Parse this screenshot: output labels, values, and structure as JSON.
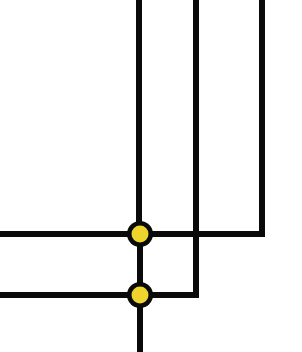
{
  "figure": {
    "name": "cladogram",
    "width": 302,
    "height": 352,
    "background_color": "#FFFFFF",
    "orientation": "tips-at-top-and-left, root-at-bottom",
    "style": "rectangular / square cladogram",
    "line_color": "#0A0A0A",
    "line_width": 6,
    "node_fill_color": "#EFD42E",
    "node_stroke_color": "#0A0A0A",
    "node_radius": 13,
    "node_inner_radius": 8.5
  },
  "chart_data": {
    "type": "diagram",
    "title": "",
    "xlabel": "",
    "ylabel": "",
    "grid": false,
    "legend": false,
    "tips": [
      {
        "id": "tip-1",
        "label": "",
        "x": 139,
        "y_top": 0,
        "y_end": 234,
        "direction": "up"
      },
      {
        "id": "tip-2",
        "label": "",
        "x": 196,
        "y_top": 0,
        "y_end": 295,
        "direction": "up"
      },
      {
        "id": "tip-3",
        "label": "",
        "x": 262,
        "y_top": 0,
        "y_end": 234,
        "direction": "up"
      },
      {
        "id": "tip-4",
        "label": "",
        "x": 0,
        "y": 234,
        "direction": "left"
      },
      {
        "id": "tip-5",
        "label": "",
        "x": 0,
        "y": 295,
        "direction": "left"
      }
    ],
    "internal_nodes": [
      {
        "id": "node-1",
        "cx": 140,
        "cy": 234,
        "fill": "#EFD42E",
        "stroke": "#0A0A0A",
        "radius": 13
      },
      {
        "id": "node-2",
        "cx": 140,
        "cy": 295,
        "fill": "#EFD42E",
        "stroke": "#0A0A0A",
        "radius": 13
      }
    ],
    "edges": [
      {
        "id": "edge-tip1-vertical",
        "path": "M 139 0 L 139 234"
      },
      {
        "id": "edge-tip2-vertical",
        "path": "M 196 0 L 196 295"
      },
      {
        "id": "edge-tip3-vertical",
        "path": "M 262 0 L 262 234"
      },
      {
        "id": "edge-node1-horizontal",
        "path": "M 0 234 L 265 234"
      },
      {
        "id": "edge-node2-horizontal",
        "path": "M 0 295 L 199 295"
      },
      {
        "id": "edge-node1-node2",
        "path": "M 140 234 L 140 295"
      },
      {
        "id": "edge-root-stem",
        "path": "M 140 295 L 140 352"
      }
    ]
  }
}
